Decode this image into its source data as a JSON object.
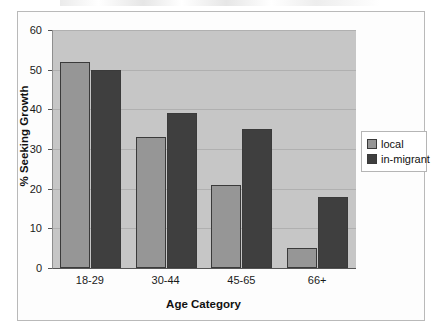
{
  "chart_data": {
    "type": "bar",
    "title": "",
    "xlabel": "Age Category",
    "ylabel": "% Seeking Growth",
    "categories": [
      "18-29",
      "30-44",
      "45-65",
      "66+"
    ],
    "series": [
      {
        "name": "local",
        "color": "#969696",
        "values": [
          52,
          33,
          21,
          5
        ]
      },
      {
        "name": "in-migrant",
        "color": "#3f3f3f",
        "values": [
          50,
          39,
          35,
          18
        ]
      }
    ],
    "ylim": [
      0,
      60
    ],
    "yticks": [
      0,
      10,
      20,
      30,
      40,
      50,
      60
    ],
    "ytick_labels": [
      "0",
      "10",
      "20",
      "30",
      "40",
      "50",
      "60"
    ],
    "grid": true,
    "legend_position": "right",
    "plot_background": "#c6c6c6",
    "figure_background": "#ffffff"
  },
  "legend": {
    "entries": [
      {
        "label": "local",
        "swatch": "legend-swatch-local"
      },
      {
        "label": "in-migrant",
        "swatch": "legend-swatch-in-migrant"
      }
    ]
  }
}
